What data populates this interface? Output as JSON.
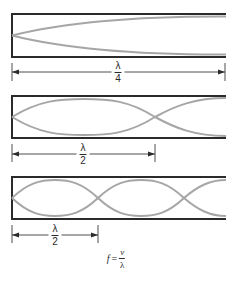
{
  "diagram": {
    "panels": [
      {
        "id": "quarter-wave",
        "dimension_label": {
          "numerator": "λ",
          "denominator": "4"
        },
        "nodes_x": [
          12
        ],
        "box": {
          "top": 14,
          "bottom": 57
        }
      },
      {
        "id": "half-wave",
        "dimension_label": {
          "numerator": "λ",
          "denominator": "2"
        },
        "nodes_x": [
          12,
          155
        ],
        "box": {
          "top": 96,
          "bottom": 138
        }
      },
      {
        "id": "full-wave",
        "dimension_label": {
          "numerator": "λ",
          "denominator": "2"
        },
        "nodes_x": [
          12,
          98,
          184
        ],
        "box": {
          "top": 177,
          "bottom": 219
        }
      }
    ],
    "formula": {
      "lhs": "f",
      "equals": "=",
      "numerator": "v",
      "denominator": "λ"
    },
    "colors": {
      "wall": "#2b2b2b",
      "wave": "#a6a6a6",
      "dimension": "#3a3a3a",
      "background": "#ffffff"
    }
  }
}
